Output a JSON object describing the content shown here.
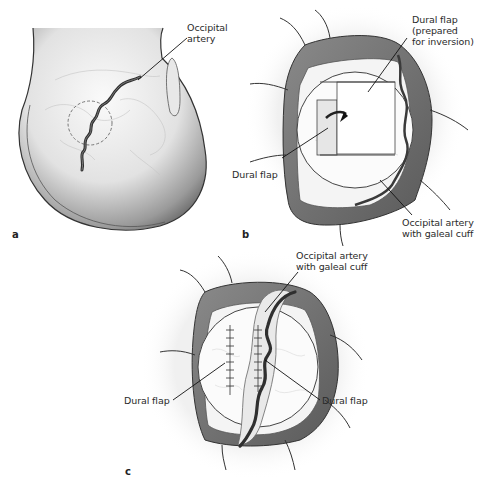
{
  "figure": {
    "panels": [
      {
        "id": "a",
        "letter": "a",
        "labels": {
          "occipital_artery_line1": "Occipital",
          "occipital_artery_line2": "artery"
        }
      },
      {
        "id": "b",
        "letter": "b",
        "labels": {
          "dural_flap_prepared_line1": "Dural flap",
          "dural_flap_prepared_line2": "(prepared",
          "dural_flap_prepared_line3": "for inversion)",
          "dural_flap": "Dural flap",
          "occipital_artery_line1": "Occipital artery",
          "occipital_artery_line2": "with galeal cuff"
        }
      },
      {
        "id": "c",
        "letter": "c",
        "labels": {
          "occipital_artery_line1": "Occipital artery",
          "occipital_artery_line2": "with galeal cuff",
          "dural_flap_left": "Dural flap",
          "dural_flap_right": "Dural flap"
        }
      }
    ],
    "colors": {
      "skin_light": "#f2f2f2",
      "skin_shadow": "#7a7a7a",
      "scalp_edge": "#6e6e6e",
      "dura": "#f7f7f7",
      "artery": "#3a3a3a",
      "outline": "#333333",
      "leader_line": "#111111"
    }
  }
}
